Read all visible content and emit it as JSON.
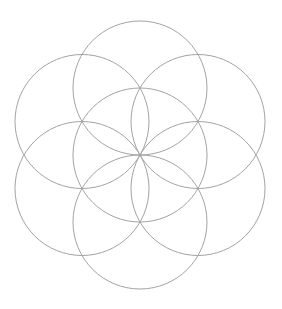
{
  "page": {
    "background_color": "#ffffff",
    "width": 282,
    "height": 309
  },
  "figure": {
    "name": "Seed of Life",
    "alt_names": [
      "Flower of Life (seed)",
      "Seven overlapping circles grid"
    ],
    "stroke_color": "#a3a3a3",
    "stroke_width": 1,
    "fill": "none",
    "center": {
      "x": 140,
      "y": 155
    },
    "radius": 67,
    "circle_count": 7,
    "bounding_box": {
      "left": 17,
      "top": 21,
      "right": 263,
      "bottom": 289
    },
    "circles": [
      {
        "id": "circle-center",
        "label": "center",
        "cx": 140,
        "cy": 155,
        "r": 67,
        "angle_deg": null
      },
      {
        "id": "circle-top",
        "label": "top",
        "cx": 140,
        "cy": 88,
        "r": 67,
        "angle_deg": 90
      },
      {
        "id": "circle-upper-right",
        "label": "upper-right",
        "cx": 198,
        "cy": 121.5,
        "r": 67,
        "angle_deg": 30
      },
      {
        "id": "circle-lower-right",
        "label": "lower-right",
        "cx": 198,
        "cy": 188.5,
        "r": 67,
        "angle_deg": 330
      },
      {
        "id": "circle-bottom",
        "label": "bottom",
        "cx": 140,
        "cy": 222,
        "r": 67,
        "angle_deg": 270
      },
      {
        "id": "circle-lower-left",
        "label": "lower-left",
        "cx": 82,
        "cy": 188.5,
        "r": 67,
        "angle_deg": 210
      },
      {
        "id": "circle-upper-left",
        "label": "upper-left",
        "cx": 82,
        "cy": 121.5,
        "r": 67,
        "angle_deg": 150
      }
    ]
  }
}
